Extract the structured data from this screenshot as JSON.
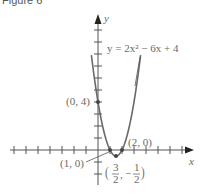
{
  "caption": "Figure 6",
  "chart_data": {
    "type": "line",
    "title": "",
    "equation": "y = 2x² − 6x + 4",
    "xlabel": "x",
    "ylabel": "y",
    "xlim": [
      -7.5,
      7.9
    ],
    "ylim": [
      -2.5,
      11.3
    ],
    "grid": false,
    "tick_spacing": 1,
    "series": [
      {
        "name": "y = 2x^2 - 6x + 4",
        "function": "2x^2 - 6x + 4",
        "color": "#6a6a6a"
      }
    ],
    "annotations": [
      {
        "point": [
          0,
          4
        ],
        "label": "(0, 4)"
      },
      {
        "point": [
          1,
          0
        ],
        "label": "(1, 0)"
      },
      {
        "point": [
          2,
          0
        ],
        "label": "(2, 0)"
      },
      {
        "point": [
          1.5,
          -0.5
        ],
        "label": "(3/2, −1/2)"
      }
    ]
  },
  "labels": {
    "x_axis": "x",
    "y_axis": "y",
    "equation": "y = 2x² − 6x + 4",
    "pt_0_4": "(0, 4)",
    "pt_1_0": "(1, 0)",
    "pt_2_0": "(2, 0)",
    "vertex_x_num": "3",
    "vertex_x_den": "2",
    "vertex_y_num": "1",
    "vertex_y_den": "2"
  }
}
